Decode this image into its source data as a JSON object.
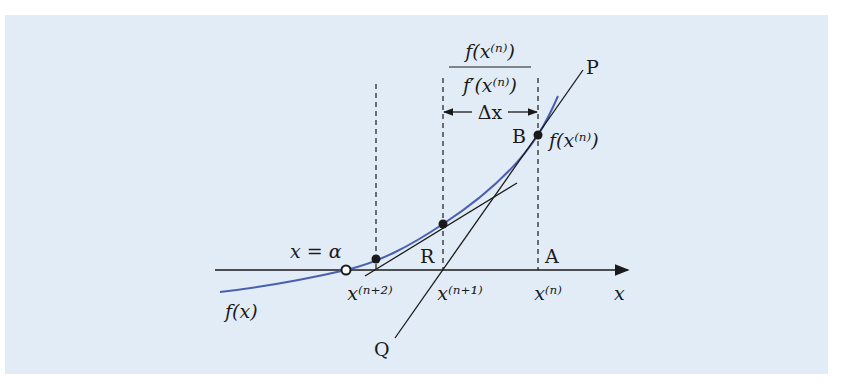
{
  "figure": {
    "background_color": "#e2ecf7",
    "curve_color": "#4a5fb0",
    "line_color": "#1a1a1a"
  },
  "labels": {
    "fraction_num": "f(x⁽ⁿ⁾)",
    "fraction_den": "f′(x⁽ⁿ⁾)",
    "delta_x": "Δx",
    "P": "P",
    "B": "B",
    "f_xn": "f(x⁽ⁿ⁾)",
    "x_alpha": "x = α",
    "R": "R",
    "A": "A",
    "x_n2": "x⁽ⁿ⁺²⁾",
    "x_n1": "x⁽ⁿ⁺¹⁾",
    "x_n": "x⁽ⁿ⁾",
    "x_axis": "x",
    "f_x": "f(x)",
    "Q": "Q"
  }
}
